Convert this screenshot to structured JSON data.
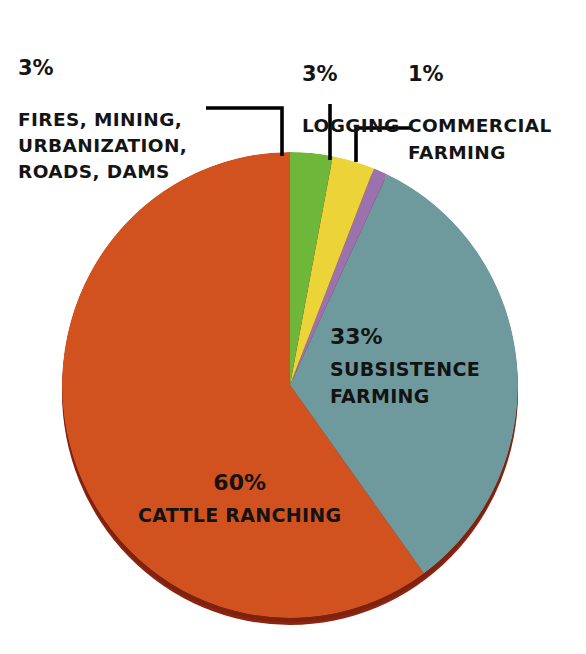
{
  "chart_data": {
    "type": "pie",
    "title": "",
    "subtitle": "",
    "xlabel": "",
    "ylabel": "",
    "legend_position": "none",
    "grid": false,
    "units": "percent",
    "total": 100,
    "categories": [
      "CATTLE RANCHING",
      "SUBSISTENCE FARMING",
      "FIRES, MINING, URBANIZATION, ROADS, DAMS",
      "LOGGING",
      "COMMERCIAL FARMING"
    ],
    "values": [
      60,
      33,
      3,
      3,
      1
    ],
    "slices": [
      {
        "key": "fires",
        "label": "FIRES, MINING,\nURBANIZATION,\nROADS, DAMS",
        "percent_text": "3%",
        "value": 3,
        "color": "#6FB73A",
        "label_placement": "callout-left",
        "start_angle_deg": 0,
        "end_angle_deg": 10.8
      },
      {
        "key": "logging",
        "label": "LOGGING",
        "percent_text": "3%",
        "value": 3,
        "color": "#EBD338",
        "label_placement": "callout-top",
        "start_angle_deg": 10.8,
        "end_angle_deg": 21.6
      },
      {
        "key": "commercial",
        "label": "COMMERCIAL\nFARMING",
        "percent_text": "1%",
        "value": 1,
        "color": "#9B72AE",
        "label_placement": "callout-right",
        "start_angle_deg": 21.6,
        "end_angle_deg": 25.2
      },
      {
        "key": "subsistence",
        "label": "SUBSISTENCE\nFARMING",
        "percent_text": "33%",
        "value": 33,
        "color": "#6E9A9E",
        "label_placement": "inside",
        "start_angle_deg": 25.2,
        "end_angle_deg": 144.0
      },
      {
        "key": "cattle",
        "label": "CATTLE\nRANCHING",
        "percent_text": "60%",
        "value": 60,
        "color": "#D1521E",
        "label_placement": "inside",
        "start_angle_deg": 144.0,
        "end_angle_deg": 360.0
      }
    ]
  },
  "colors": {
    "background": "#ffffff",
    "text": "#141414",
    "leader_line": "#000000",
    "cattle_orange": "#D1521E",
    "cattle_orange_shadow": "#8E2410",
    "subsistence_teal": "#6E9A9E",
    "subsistence_teal_shadow": "#4E7276",
    "fires_green": "#6FB73A",
    "logging_yellow": "#EBD338",
    "commercial_purple": "#9B72AE"
  },
  "callouts": {
    "fires": {
      "percent": "3%",
      "caption": "FIRES, MINING,\nURBANIZATION,\nROADS, DAMS"
    },
    "logging": {
      "percent": "3%",
      "caption": "LOGGING"
    },
    "commercial": {
      "percent": "1%",
      "caption": "COMMERCIAL\nFARMING"
    }
  },
  "inline_labels": {
    "subsistence": {
      "percent": "33%",
      "caption": "SUBSISTENCE\nFARMING"
    },
    "cattle": {
      "percent": "60%",
      "caption": "CATTLE\nRANCHING"
    }
  }
}
